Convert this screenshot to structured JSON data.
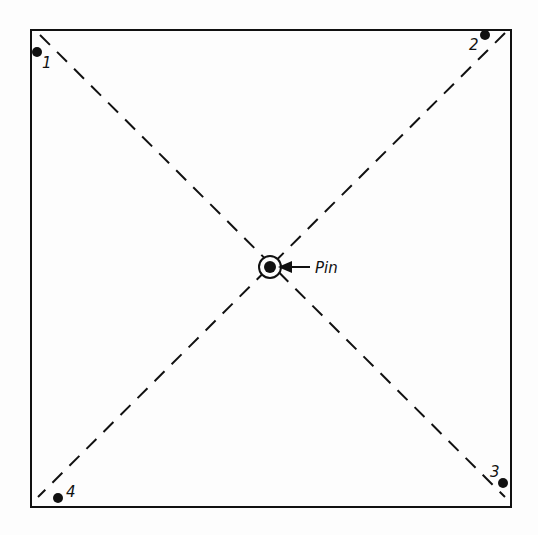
{
  "diagram": {
    "type": "square-with-diagonals",
    "pin_label": "Pin",
    "corners": [
      {
        "label": "1",
        "position": "top-left"
      },
      {
        "label": "2",
        "position": "top-right"
      },
      {
        "label": "3",
        "position": "bottom-right"
      },
      {
        "label": "4",
        "position": "bottom-left"
      }
    ],
    "colors": {
      "line": "#111111",
      "background": "#fdfdfd"
    }
  }
}
